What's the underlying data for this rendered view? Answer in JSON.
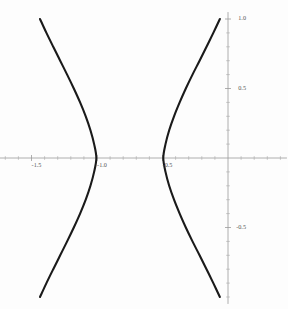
{
  "chart_data": {
    "type": "line",
    "title": "",
    "subtitle": "",
    "xlabel": "",
    "ylabel": "",
    "xlim": [
      -2.05,
      0.45
    ],
    "ylim": [
      -1.05,
      1.05
    ],
    "grid": false,
    "legend": null,
    "background_color": "#fdfdfd",
    "curve_color": "#1a1a1a",
    "axis_color": "#9a9a9a",
    "label_color": "#565656",
    "x_axis": {
      "position_y_value": 0,
      "major_ticks": [
        -1.5,
        -1.0,
        -0.5
      ],
      "major_tick_labels": [
        "-1.5",
        "-1.0",
        "-0.5"
      ],
      "minor_tick_step": 0.1,
      "minor_ticks": [
        -2.0,
        -1.9,
        -1.8,
        -1.7,
        -1.6,
        -1.4,
        -1.3,
        -1.2,
        -1.1,
        -0.9,
        -0.8,
        -0.7,
        -0.6,
        -0.4,
        -0.3,
        -0.2,
        -0.1,
        0.1,
        0.2,
        0.3,
        0.4
      ]
    },
    "y_axis": {
      "position_x_value": 0,
      "major_ticks": [
        1.0,
        0.5,
        -0.5
      ],
      "major_tick_labels": [
        "1.0",
        "0.5",
        "-0.5"
      ],
      "minor_tick_step": 0.1,
      "minor_ticks": [
        0.9,
        0.8,
        0.7,
        0.6,
        0.4,
        0.3,
        0.2,
        0.1,
        -0.1,
        -0.2,
        -0.3,
        -0.4,
        -0.6,
        -0.7,
        -0.8,
        -0.9,
        -1.0
      ]
    },
    "series": [
      {
        "name": "left-branch",
        "description": "left branch of hyperbola opening leftward, vertex near x = -1.0",
        "vertex": [
          -1.0,
          0.0
        ],
        "points": [
          [
            -1.435,
            1.0
          ],
          [
            -1.386,
            0.9
          ],
          [
            -1.334,
            0.8
          ],
          [
            -1.281,
            0.7
          ],
          [
            -1.228,
            0.6
          ],
          [
            -1.177,
            0.5
          ],
          [
            -1.129,
            0.4
          ],
          [
            -1.086,
            0.3
          ],
          [
            -1.05,
            0.2
          ],
          [
            -1.022,
            0.1
          ],
          [
            -1.005,
            0.0
          ],
          [
            -1.022,
            -0.1
          ],
          [
            -1.05,
            -0.2
          ],
          [
            -1.086,
            -0.3
          ],
          [
            -1.129,
            -0.4
          ],
          [
            -1.177,
            -0.5
          ],
          [
            -1.228,
            -0.6
          ],
          [
            -1.281,
            -0.7
          ],
          [
            -1.334,
            -0.8
          ],
          [
            -1.386,
            -0.9
          ],
          [
            -1.435,
            -1.0
          ]
        ]
      },
      {
        "name": "right-branch",
        "description": "right branch of hyperbola opening rightward, vertex near x = -0.5",
        "vertex": [
          -0.5,
          0.0
        ],
        "points": [
          [
            -0.062,
            1.0
          ],
          [
            -0.112,
            0.9
          ],
          [
            -0.164,
            0.8
          ],
          [
            -0.217,
            0.7
          ],
          [
            -0.271,
            0.6
          ],
          [
            -0.322,
            0.5
          ],
          [
            -0.369,
            0.4
          ],
          [
            -0.412,
            0.3
          ],
          [
            -0.449,
            0.2
          ],
          [
            -0.477,
            0.1
          ],
          [
            -0.494,
            0.0
          ],
          [
            -0.477,
            -0.1
          ],
          [
            -0.449,
            -0.2
          ],
          [
            -0.412,
            -0.3
          ],
          [
            -0.369,
            -0.4
          ],
          [
            -0.322,
            -0.5
          ],
          [
            -0.271,
            -0.6
          ],
          [
            -0.217,
            -0.7
          ],
          [
            -0.164,
            -0.8
          ],
          [
            -0.112,
            -0.9
          ],
          [
            -0.062,
            -1.0
          ]
        ]
      }
    ]
  }
}
